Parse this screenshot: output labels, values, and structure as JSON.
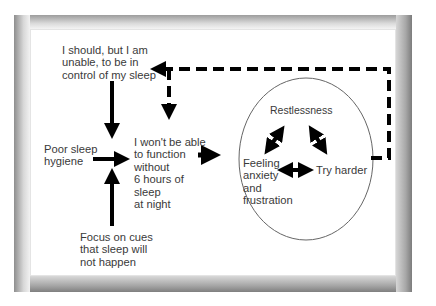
{
  "diagram": {
    "type": "flowchart",
    "nodes": {
      "should_control": "I should, but I am\nunable, to be in\ncontrol of my sleep",
      "poor_hygiene": "Poor sleep\nhygiene",
      "wont_function": "I won't be able\nto function\nwithout\n6 hours of\nsleep\nat night",
      "focus_cues": "Focus on cues\nthat sleep will\nnot happen",
      "restlessness": "Restlessness",
      "anxiety": "Feeling\nanxiety\nand\nfrustration",
      "try_harder": "Try harder"
    },
    "edges": [
      {
        "from": "should_control",
        "to": "wont_function",
        "style": "solid"
      },
      {
        "from": "poor_hygiene",
        "to": "wont_function",
        "style": "solid"
      },
      {
        "from": "focus_cues",
        "to": "wont_function",
        "style": "solid"
      },
      {
        "from": "wont_function",
        "to": "cycle_circle",
        "style": "solid"
      },
      {
        "from": "cycle_circle",
        "to": "should_control",
        "style": "dashed"
      },
      {
        "from": "cycle_circle",
        "to": "wont_function",
        "style": "dashed"
      },
      {
        "from": "restlessness",
        "to": "anxiety",
        "style": "solid",
        "bidirectional": true
      },
      {
        "from": "restlessness",
        "to": "try_harder",
        "style": "solid",
        "bidirectional": true
      },
      {
        "from": "anxiety",
        "to": "try_harder",
        "style": "solid",
        "bidirectional": true
      }
    ],
    "colors": {
      "text": "#3a3a3a",
      "arrow": "#000000",
      "circle": "#666666",
      "frame": "#9a9a9a"
    }
  }
}
